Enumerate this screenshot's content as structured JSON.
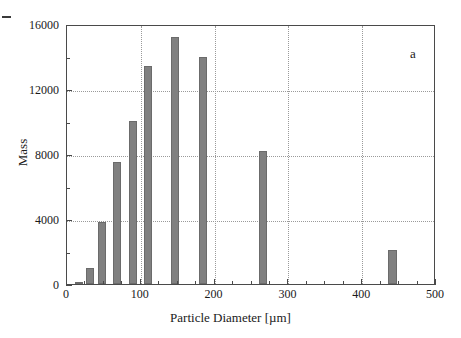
{
  "figure": {
    "panel_label": "a",
    "background_color": "#ffffff",
    "frame_color": "#4a4a4a",
    "bar_color": "#808080",
    "bar_edge_color": "#6b6b6b",
    "grid_color": "#9a9a9a"
  },
  "chart_data": {
    "type": "bar",
    "title": "",
    "subtitle": "",
    "xlabel": "Particle Diameter [µm]",
    "ylabel": "Mass",
    "xlim": [
      0,
      500
    ],
    "ylim": [
      0,
      16000
    ],
    "grid": true,
    "legend": null,
    "annotations": [
      {
        "text": "a",
        "x": 470,
        "y": 15000
      }
    ],
    "xticks": [
      0,
      100,
      200,
      300,
      400,
      500
    ],
    "xtick_labels": [
      "0",
      "100",
      "200",
      "300",
      "400",
      "500"
    ],
    "xminor_ticks": [
      25,
      50,
      75,
      125,
      150,
      175,
      225,
      250,
      275,
      325,
      350,
      375,
      425,
      450,
      475
    ],
    "yticks": [
      0,
      4000,
      8000,
      12000,
      16000
    ],
    "ytick_labels": [
      "0",
      "4000",
      "8000",
      "12000",
      "16000"
    ],
    "yminor_ticks": [
      2000,
      6000,
      10000,
      14000
    ],
    "x": [
      16,
      31,
      48,
      68,
      89,
      110,
      146,
      184,
      265,
      441
    ],
    "values": [
      150,
      1000,
      3800,
      7500,
      10050,
      13400,
      15200,
      13950,
      8200,
      2100
    ],
    "bar_widths": [
      11,
      11,
      11,
      11,
      11,
      11,
      11,
      11,
      11,
      11
    ],
    "categories": [
      "16",
      "31",
      "48",
      "68",
      "89",
      "110",
      "146",
      "184",
      "265",
      "441"
    ]
  }
}
